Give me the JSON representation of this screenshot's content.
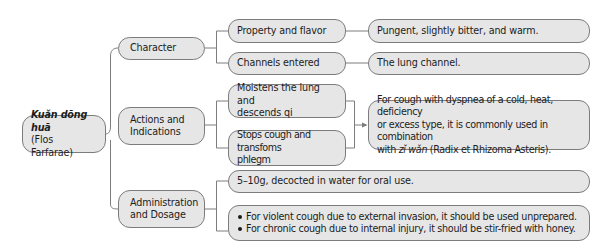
{
  "root": {
    "title_italic": "Kuǎn dōng huā",
    "subtitle": "(Flos Farfarae)"
  },
  "branches": {
    "character": {
      "label": "Character",
      "children": {
        "property": {
          "label": "Property and flavor",
          "detail": "Pungent, slightly bitter, and warm."
        },
        "channels": {
          "label": "Channels entered",
          "detail": "The lung channel."
        }
      }
    },
    "actions": {
      "label_line1": "Actions and",
      "label_line2": "Indications",
      "children": {
        "moistens": {
          "line1": "Moistens the lung and",
          "line2": "descends qi"
        },
        "stops": {
          "line1": "Stops cough and transfoms",
          "line2": "phlegm"
        },
        "indication": {
          "line1": "For cough with dyspnea of a cold, heat, deficiency",
          "line2": "or excess type, it is commonly used in combination",
          "line3_prefix": "with ",
          "line3_italic": "zǐ wǎn",
          "line3_suffix": " (Radix et Rhizoma Asteris)."
        }
      }
    },
    "administration": {
      "label_line1": "Administration",
      "label_line2": "and Dosage",
      "children": {
        "dosage": "5–10g, decocted in water for oral use.",
        "notes": [
          "For violent cough due to external invasion, it should be used unprepared.",
          "For chronic cough due to internal injury, it should be stir-fried with honey."
        ]
      }
    }
  },
  "colors": {
    "box_fill": "#e6e6e6",
    "box_border": "#7c7c7c",
    "connector": "#7c7c7c"
  }
}
